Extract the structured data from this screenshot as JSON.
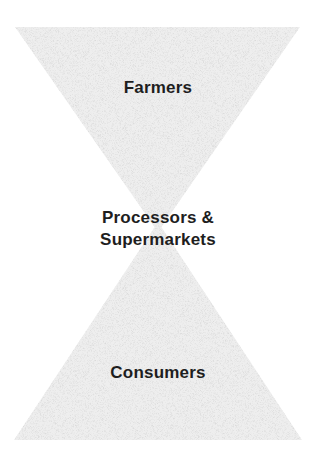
{
  "diagram": {
    "type": "hourglass",
    "colors": {
      "fill": "#ececec",
      "speckle": "#d4d4d4",
      "text": "#1e1e1e",
      "background": "#ffffff"
    },
    "tiers": [
      {
        "id": "top",
        "label": "Farmers"
      },
      {
        "id": "middle",
        "label_line1": "Processors &",
        "label_line2": "Supermarkets"
      },
      {
        "id": "bottom",
        "label": "Consumers"
      }
    ]
  }
}
